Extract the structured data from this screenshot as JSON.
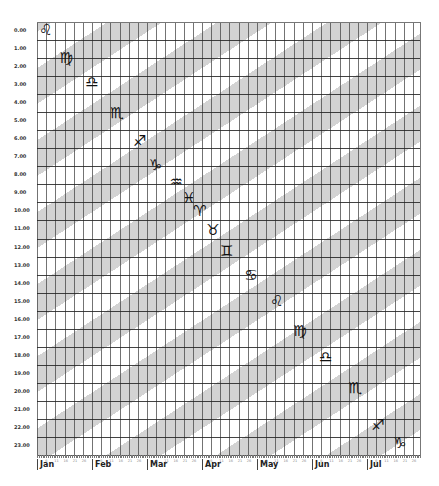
{
  "chart_data": {
    "type": "heatmap",
    "title": "",
    "xlabel": "",
    "ylabel": "",
    "x_months": [
      "Jan",
      "Feb",
      "Mar",
      "Apr",
      "May",
      "Jun",
      "Jul"
    ],
    "x_day_ticks": [
      6,
      11,
      16,
      21,
      26
    ],
    "y_hours": [
      "0.00",
      "1.00",
      "2.00",
      "3.00",
      "4.00",
      "5.00",
      "6.00",
      "7.00",
      "8.00",
      "9.00",
      "10.00",
      "11.00",
      "12.00",
      "13.00",
      "14.00",
      "15.00",
      "16.00",
      "17.00",
      "18.00",
      "19.00",
      "20.00",
      "21.00",
      "22.00",
      "23.00"
    ],
    "ylim": [
      0,
      24
    ],
    "grid": true,
    "band_colors": {
      "gray": "#d3d3d3",
      "white": "#ffffff"
    },
    "band_period_hours": 4,
    "band_slope_hours_per_month": 2,
    "zodiac_glyphs": [
      {
        "sign": "Leo",
        "symbol": "♌",
        "month_pos": 0.16,
        "hour": 0.45
      },
      {
        "sign": "Virgo",
        "symbol": "♍",
        "month_pos": 0.53,
        "hour": 2.0
      },
      {
        "sign": "Libra",
        "symbol": "♎",
        "month_pos": 1.0,
        "hour": 3.35
      },
      {
        "sign": "Scorpio",
        "symbol": "♏",
        "month_pos": 1.45,
        "hour": 5.05
      },
      {
        "sign": "Sagittarius",
        "symbol": "♐",
        "month_pos": 1.87,
        "hour": 6.6
      },
      {
        "sign": "Capricorn",
        "symbol": "♑",
        "month_pos": 2.16,
        "hour": 7.93
      },
      {
        "sign": "Aquarius",
        "symbol": "♒",
        "month_pos": 2.53,
        "hour": 8.87
      },
      {
        "sign": "Pisces",
        "symbol": "♓",
        "month_pos": 2.76,
        "hour": 9.76
      },
      {
        "sign": "Aries",
        "symbol": "♈",
        "month_pos": 2.96,
        "hour": 10.48
      },
      {
        "sign": "Taurus",
        "symbol": "♉",
        "month_pos": 3.2,
        "hour": 11.53
      },
      {
        "sign": "Gemini",
        "symbol": "♊",
        "month_pos": 3.45,
        "hour": 12.7
      },
      {
        "sign": "Cancer",
        "symbol": "♋",
        "month_pos": 3.89,
        "hour": 14.02
      },
      {
        "sign": "Leo",
        "symbol": "♌",
        "month_pos": 4.36,
        "hour": 15.47
      },
      {
        "sign": "Virgo",
        "symbol": "♍",
        "month_pos": 4.78,
        "hour": 17.13
      },
      {
        "sign": "Libra",
        "symbol": "♎",
        "month_pos": 5.25,
        "hour": 18.57
      },
      {
        "sign": "Scorpio",
        "symbol": "♏",
        "month_pos": 5.78,
        "hour": 20.28
      },
      {
        "sign": "Sagittarius",
        "symbol": "♐",
        "month_pos": 6.2,
        "hour": 22.34
      },
      {
        "sign": "Capricorn",
        "symbol": "♑",
        "month_pos": 6.6,
        "hour": 23.34
      }
    ]
  }
}
